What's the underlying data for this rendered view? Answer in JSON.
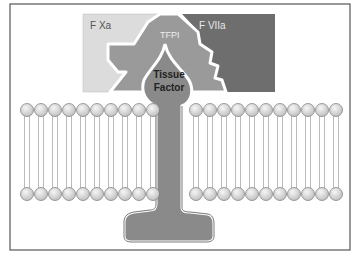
{
  "diagram": {
    "labels": {
      "fxa": "F Xa",
      "fviia": "F VIIa",
      "tfpi": "TFPI",
      "tissue_factor_line1": "Tissue",
      "tissue_factor_line2": "Factor"
    },
    "colors": {
      "fxa": "#dcdcdc",
      "fviia": "#6e6e6e",
      "tfpi": "#9a9a9a",
      "tissue_factor": "#8a8a8a",
      "lipid_head": "#e2e2e2",
      "border": "#555555"
    },
    "membrane": {
      "left_lipid_count": 10,
      "right_lipid_count": 11
    }
  }
}
